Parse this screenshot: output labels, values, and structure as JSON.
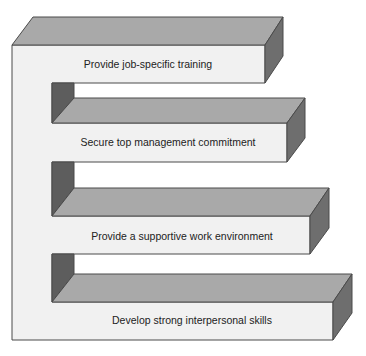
{
  "diagram": {
    "type": "staircase-3d-steps",
    "colors": {
      "background": "#ffffff",
      "front_face": "#f1f1f1",
      "top_face": "#a9a9a9",
      "side_face": "#6e6e6e",
      "inner_shadow": "#5d5d5d",
      "outline": "#4a4a4a",
      "text": "#222222"
    },
    "steps": [
      {
        "label": "Provide job-specific training"
      },
      {
        "label": "Secure top management commitment"
      },
      {
        "label": "Provide a supportive work environment"
      },
      {
        "label": "Develop strong interpersonal skills"
      }
    ]
  }
}
